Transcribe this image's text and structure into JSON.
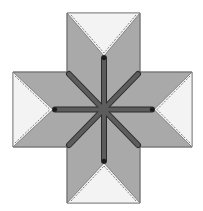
{
  "diagram": {
    "kind": "eight-point star quilt block",
    "center": [
      103.5,
      109.5
    ],
    "colors": {
      "background": "#ffffff",
      "diamond_fill": "#a9a9a9",
      "corner_fill": "#f3f3f3",
      "bar_fill": "#5c5c5c",
      "bar_stroke": "#2a2a2a",
      "outline": "#707070",
      "seam": "#4a4a4a"
    },
    "arms": [
      "top",
      "right",
      "bottom",
      "left"
    ],
    "spokes": 8
  }
}
